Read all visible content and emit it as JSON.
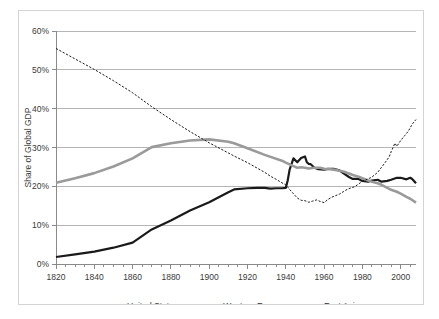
{
  "chart_data": {
    "type": "line",
    "title": "",
    "subtitle": "",
    "xlabel": "",
    "ylabel": "Share of Global GDP",
    "xlim": [
      1820,
      2008
    ],
    "ylim": [
      0,
      0.6
    ],
    "grid": true,
    "legend_position": "bottom",
    "y_tick_labels": [
      "0%",
      "10%",
      "20%",
      "30%",
      "40%",
      "50%",
      "60%"
    ],
    "y_tick_values": [
      0,
      0.1,
      0.2,
      0.3,
      0.4,
      0.5,
      0.6
    ],
    "x_tick_labels": [
      "1820",
      "1840",
      "1860",
      "1880",
      "1900",
      "1920",
      "1940",
      "1960",
      "1980",
      "2000"
    ],
    "x_tick_values": [
      1820,
      1840,
      1860,
      1880,
      1900,
      1920,
      1940,
      1960,
      1980,
      2000
    ],
    "x_minor_step": 5,
    "series": [
      {
        "name": "United States",
        "color": "#1a1a1a",
        "style": "solid",
        "width": 2.2,
        "x": [
          1820,
          1830,
          1840,
          1850,
          1860,
          1870,
          1880,
          1890,
          1900,
          1910,
          1913,
          1920,
          1925,
          1929,
          1932,
          1935,
          1938,
          1940,
          1941,
          1942,
          1944,
          1946,
          1948,
          1950,
          1951,
          1952,
          1953,
          1955,
          1957,
          1960,
          1962,
          1965,
          1968,
          1970,
          1973,
          1975,
          1978,
          1980,
          1983,
          1985,
          1988,
          1990,
          1993,
          1995,
          1998,
          2000,
          2003,
          2005,
          2006,
          2008
        ],
        "y": [
          0.018,
          0.025,
          0.032,
          0.042,
          0.055,
          0.089,
          0.112,
          0.138,
          0.159,
          0.185,
          0.192,
          0.195,
          0.196,
          0.196,
          0.194,
          0.195,
          0.195,
          0.196,
          0.215,
          0.243,
          0.272,
          0.262,
          0.273,
          0.277,
          0.262,
          0.258,
          0.257,
          0.248,
          0.244,
          0.243,
          0.245,
          0.245,
          0.241,
          0.234,
          0.224,
          0.219,
          0.219,
          0.214,
          0.212,
          0.215,
          0.217,
          0.212,
          0.214,
          0.217,
          0.222,
          0.222,
          0.218,
          0.222,
          0.219,
          0.208
        ]
      },
      {
        "name": "Western Europe",
        "color": "#9a9a9a",
        "style": "solid",
        "width": 2.6,
        "x": [
          1820,
          1830,
          1840,
          1850,
          1860,
          1870,
          1880,
          1890,
          1900,
          1910,
          1913,
          1920,
          1929,
          1938,
          1940,
          1944,
          1946,
          1948,
          1950,
          1952,
          1955,
          1958,
          1960,
          1963,
          1965,
          1968,
          1970,
          1973,
          1975,
          1978,
          1980,
          1983,
          1985,
          1988,
          1990,
          1993,
          1995,
          1998,
          2000,
          2003,
          2005,
          2008
        ],
        "y": [
          0.209,
          0.221,
          0.234,
          0.251,
          0.272,
          0.301,
          0.311,
          0.318,
          0.321,
          0.315,
          0.311,
          0.298,
          0.281,
          0.266,
          0.261,
          0.252,
          0.248,
          0.249,
          0.248,
          0.246,
          0.248,
          0.248,
          0.245,
          0.244,
          0.243,
          0.24,
          0.238,
          0.233,
          0.229,
          0.225,
          0.221,
          0.215,
          0.212,
          0.208,
          0.204,
          0.196,
          0.191,
          0.186,
          0.181,
          0.173,
          0.168,
          0.158
        ]
      },
      {
        "name": "East Asia",
        "color": "#1a1a1a",
        "style": "dashed",
        "width": 1.0,
        "x": [
          1820,
          1830,
          1840,
          1850,
          1860,
          1870,
          1880,
          1890,
          1900,
          1910,
          1913,
          1920,
          1929,
          1932,
          1935,
          1938,
          1940,
          1942,
          1944,
          1946,
          1948,
          1950,
          1952,
          1954,
          1956,
          1958,
          1960,
          1962,
          1964,
          1966,
          1968,
          1970,
          1972,
          1974,
          1976,
          1978,
          1980,
          1983,
          1985,
          1988,
          1990,
          1992,
          1994,
          1995,
          1997,
          1998,
          2000,
          2002,
          2004,
          2006,
          2008
        ],
        "y": [
          0.555,
          0.528,
          0.501,
          0.472,
          0.441,
          0.405,
          0.372,
          0.341,
          0.312,
          0.286,
          0.278,
          0.261,
          0.236,
          0.226,
          0.218,
          0.209,
          0.204,
          0.192,
          0.181,
          0.17,
          0.164,
          0.163,
          0.159,
          0.162,
          0.165,
          0.161,
          0.158,
          0.166,
          0.172,
          0.176,
          0.18,
          0.186,
          0.192,
          0.196,
          0.199,
          0.206,
          0.213,
          0.219,
          0.224,
          0.236,
          0.249,
          0.262,
          0.276,
          0.289,
          0.311,
          0.303,
          0.318,
          0.33,
          0.342,
          0.36,
          0.372
        ]
      }
    ]
  },
  "legend": {
    "items": [
      {
        "label": "United States"
      },
      {
        "label": "Western Europe"
      },
      {
        "label": "East Asia"
      }
    ]
  }
}
